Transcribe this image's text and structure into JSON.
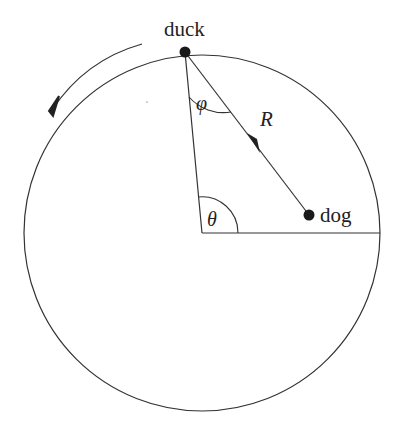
{
  "diagram": {
    "labels": {
      "duck": "duck",
      "dog": "dog",
      "radius": "R",
      "phi": "φ",
      "theta": "θ"
    },
    "geometry": {
      "circle_center": [
        202,
        233
      ],
      "circle_radius": 178,
      "duck_position": [
        185,
        52
      ],
      "dog_position": [
        309,
        215
      ]
    },
    "colors": {
      "stroke": "#333333",
      "point": "#1a1a1a",
      "background": "#ffffff"
    },
    "direction_arrow": "counterclockwise"
  }
}
